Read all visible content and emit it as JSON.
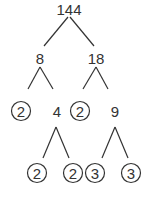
{
  "diagram": {
    "type": "factor-tree",
    "root": "144",
    "nodes": [
      {
        "id": "n144",
        "label": "144",
        "x": 69,
        "y": 9,
        "prime": false
      },
      {
        "id": "n8",
        "label": "8",
        "x": 40,
        "y": 58,
        "prime": false
      },
      {
        "id": "n18",
        "label": "18",
        "x": 96,
        "y": 58,
        "prime": false
      },
      {
        "id": "n2a",
        "label": "2",
        "x": 21,
        "y": 111,
        "prime": true
      },
      {
        "id": "n4",
        "label": "4",
        "x": 57,
        "y": 111,
        "prime": false
      },
      {
        "id": "n2b",
        "label": "2",
        "x": 80,
        "y": 111,
        "prime": true
      },
      {
        "id": "n9",
        "label": "9",
        "x": 115,
        "y": 111,
        "prime": false
      },
      {
        "id": "n2c",
        "label": "2",
        "x": 37,
        "y": 173,
        "prime": true
      },
      {
        "id": "n2d",
        "label": "2",
        "x": 73,
        "y": 173,
        "prime": true
      },
      {
        "id": "n3a",
        "label": "3",
        "x": 95,
        "y": 173,
        "prime": true
      },
      {
        "id": "n3b",
        "label": "3",
        "x": 131,
        "y": 173,
        "prime": true
      }
    ],
    "edges": [
      {
        "from": "144",
        "to": "8"
      },
      {
        "from": "144",
        "to": "18"
      },
      {
        "from": "8",
        "to": "2"
      },
      {
        "from": "8",
        "to": "4"
      },
      {
        "from": "18",
        "to": "2"
      },
      {
        "from": "18",
        "to": "9"
      },
      {
        "from": "4",
        "to": "2"
      },
      {
        "from": "4",
        "to": "2"
      },
      {
        "from": "9",
        "to": "3"
      },
      {
        "from": "9",
        "to": "3"
      }
    ],
    "colors": {
      "ink": "#333333",
      "background": "#ffffff"
    }
  }
}
